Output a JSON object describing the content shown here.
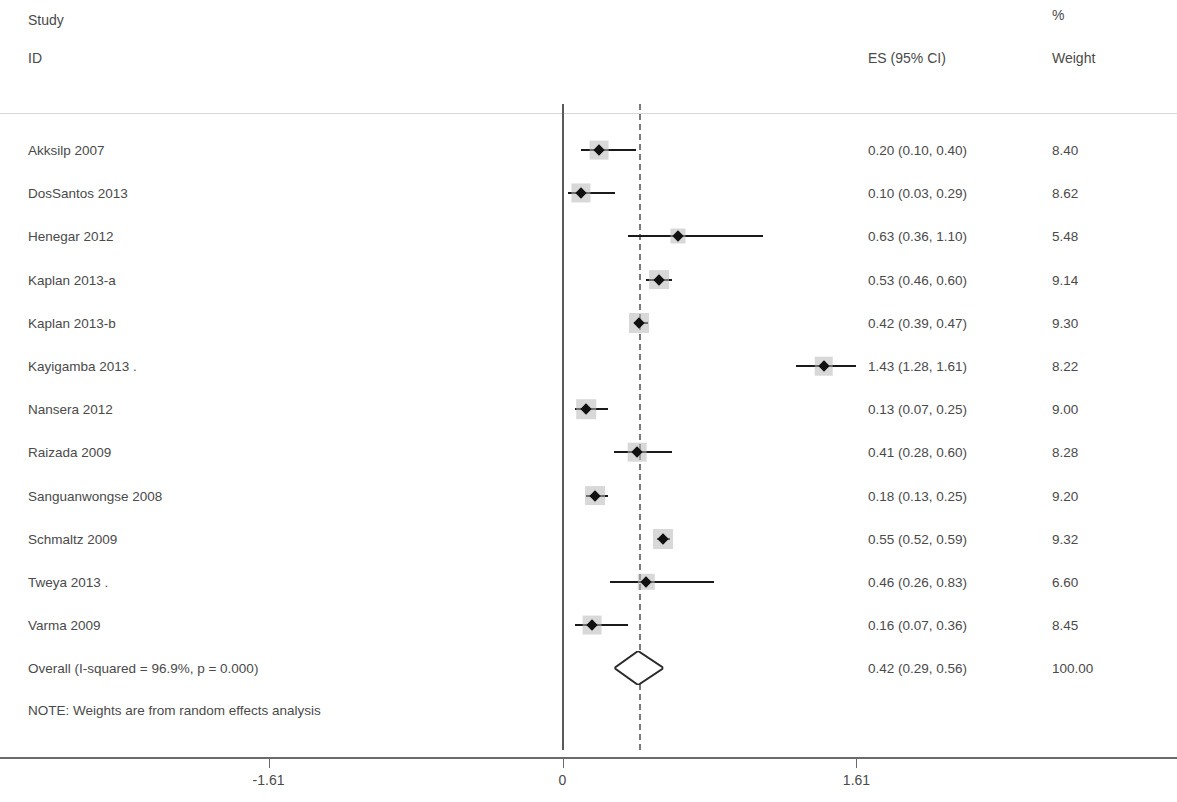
{
  "header": {
    "study": "Study",
    "id": "ID",
    "percent": "%",
    "es": "ES (95% CI)",
    "weight": "Weight"
  },
  "note": "NOTE: Weights are from random effects analysis",
  "axis": {
    "ticks": [
      {
        "label": "-1.61",
        "value": -1.61
      },
      {
        "label": "0",
        "value": 0
      },
      {
        "label": "1.61",
        "value": 1.61
      }
    ]
  },
  "rows": [
    {
      "label": "Akksilp 2007",
      "es_text": "0.20 (0.10, 0.40)",
      "weight_text": "8.40"
    },
    {
      "label": "DosSantos 2013",
      "es_text": "0.10 (0.03, 0.29)",
      "weight_text": "8.62"
    },
    {
      "label": "Henegar 2012",
      "es_text": "0.63 (0.36, 1.10)",
      "weight_text": "5.48"
    },
    {
      "label": "Kaplan 2013-a",
      "es_text": "0.53 (0.46, 0.60)",
      "weight_text": "9.14"
    },
    {
      "label": "Kaplan 2013-b",
      "es_text": "0.42 (0.39, 0.47)",
      "weight_text": "9.30"
    },
    {
      "label": "Kayigamba 2013 .",
      "es_text": "1.43 (1.28, 1.61)",
      "weight_text": "8.22"
    },
    {
      "label": "Nansera 2012",
      "es_text": "0.13 (0.07, 0.25)",
      "weight_text": "9.00"
    },
    {
      "label": "Raizada 2009",
      "es_text": "0.41 (0.28, 0.60)",
      "weight_text": "8.28"
    },
    {
      "label": "Sanguanwongse 2008",
      "es_text": "0.18 (0.13, 0.25)",
      "weight_text": "9.20"
    },
    {
      "label": "Schmaltz 2009",
      "es_text": "0.55 (0.52, 0.59)",
      "weight_text": "9.32"
    },
    {
      "label": "Tweya 2013 .",
      "es_text": "0.46 (0.26, 0.83)",
      "weight_text": "6.60"
    },
    {
      "label": "Varma 2009",
      "es_text": "0.16 (0.07, 0.36)",
      "weight_text": "8.45"
    },
    {
      "label": "Overall  (I-squared = 96.9%, p = 0.000)",
      "es_text": "0.42 (0.29, 0.56)",
      "weight_text": "100.00"
    }
  ],
  "chart_data": {
    "type": "forest",
    "title": "",
    "xlabel": "",
    "ylabel": "",
    "xlim": [
      -2.6,
      3.2
    ],
    "xticks": [
      -1.61,
      0,
      1.61
    ],
    "grid": false,
    "legend": null,
    "null_line": 0.42,
    "zero_line": 0,
    "effect_measure": "ES (95% CI)",
    "heterogeneity": {
      "i_squared": "96.9%",
      "p": "0.000"
    },
    "model": "random effects",
    "studies": [
      {
        "name": "Akksilp 2007",
        "es": 0.2,
        "lcl": 0.1,
        "ucl": 0.4,
        "weight": 8.4
      },
      {
        "name": "DosSantos 2013",
        "es": 0.1,
        "lcl": 0.03,
        "ucl": 0.29,
        "weight": 8.62
      },
      {
        "name": "Henegar 2012",
        "es": 0.63,
        "lcl": 0.36,
        "ucl": 1.1,
        "weight": 5.48
      },
      {
        "name": "Kaplan 2013-a",
        "es": 0.53,
        "lcl": 0.46,
        "ucl": 0.6,
        "weight": 9.14
      },
      {
        "name": "Kaplan 2013-b",
        "es": 0.42,
        "lcl": 0.39,
        "ucl": 0.47,
        "weight": 9.3
      },
      {
        "name": "Kayigamba 2013 .",
        "es": 1.43,
        "lcl": 1.28,
        "ucl": 1.61,
        "weight": 8.22
      },
      {
        "name": "Nansera 2012",
        "es": 0.13,
        "lcl": 0.07,
        "ucl": 0.25,
        "weight": 9.0
      },
      {
        "name": "Raizada 2009",
        "es": 0.41,
        "lcl": 0.28,
        "ucl": 0.6,
        "weight": 8.28
      },
      {
        "name": "Sanguanwongse 2008",
        "es": 0.18,
        "lcl": 0.13,
        "ucl": 0.25,
        "weight": 9.2
      },
      {
        "name": "Schmaltz 2009",
        "es": 0.55,
        "lcl": 0.52,
        "ucl": 0.59,
        "weight": 9.32
      },
      {
        "name": "Tweya 2013 .",
        "es": 0.46,
        "lcl": 0.26,
        "ucl": 0.83,
        "weight": 6.6
      },
      {
        "name": "Varma 2009",
        "es": 0.16,
        "lcl": 0.07,
        "ucl": 0.36,
        "weight": 8.45
      }
    ],
    "overall": {
      "name": "Overall",
      "es": 0.42,
      "lcl": 0.29,
      "ucl": 0.56,
      "weight": 100.0
    }
  }
}
